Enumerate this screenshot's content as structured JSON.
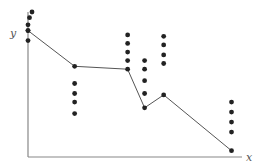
{
  "chart_data": {
    "type": "scatter",
    "title": "",
    "xlabel": "x",
    "ylabel": "y",
    "grid": false,
    "legend": null,
    "clusters": [
      {
        "x": 0.0,
        "points": [
          1.0,
          0.96,
          0.91,
          0.87,
          0.8
        ],
        "line_y": 0.87
      },
      {
        "x": 0.22,
        "points": [
          0.5,
          0.43,
          0.37,
          0.29
        ],
        "line_y": 0.62
      },
      {
        "x": 0.47,
        "points": [
          0.84,
          0.78,
          0.72,
          0.66
        ],
        "line_y": 0.6
      },
      {
        "x": 0.55,
        "points": [
          0.66,
          0.6,
          0.52,
          0.43
        ],
        "line_y": 0.33
      },
      {
        "x": 0.64,
        "points": [
          0.83,
          0.77,
          0.7,
          0.64
        ],
        "line_y": 0.42
      },
      {
        "x": 0.96,
        "points": [
          0.37,
          0.3,
          0.23,
          0.16
        ],
        "line_y": 0.03
      }
    ],
    "line": {
      "x": [
        0.0,
        0.22,
        0.47,
        0.55,
        0.64,
        0.96
      ],
      "y": [
        0.87,
        0.62,
        0.6,
        0.33,
        0.42,
        0.03
      ]
    },
    "xlim": [
      0,
      1
    ],
    "ylim": [
      0,
      1
    ],
    "colors": {
      "points": "#222222",
      "line": "#555555",
      "axes": "#888888"
    }
  },
  "labels": {
    "x_axis": "x",
    "y_axis": "y"
  }
}
